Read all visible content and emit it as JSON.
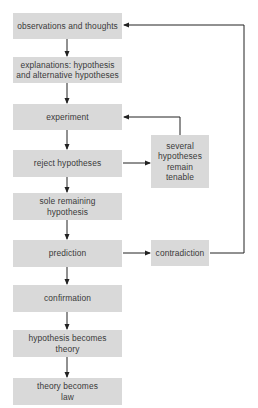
{
  "diagram": {
    "type": "flowchart",
    "main_flow": [
      {
        "id": "observations",
        "label": "observations and thoughts"
      },
      {
        "id": "explanations",
        "label": "explanations: hypothesis and alternative hypotheses"
      },
      {
        "id": "experiment",
        "label": "experiment"
      },
      {
        "id": "reject",
        "label": "reject hypotheses"
      },
      {
        "id": "sole",
        "label": "sole remaining hypothesis"
      },
      {
        "id": "prediction",
        "label": "prediction"
      },
      {
        "id": "confirmation",
        "label": "confirmation"
      },
      {
        "id": "hyp_theory",
        "label": "hypothesis becomes theory"
      },
      {
        "id": "theory_law",
        "label": "theory becomes law"
      }
    ],
    "side_nodes": [
      {
        "id": "several",
        "label": "several hypotheses remain tenable"
      },
      {
        "id": "contradiction",
        "label": "contradiction"
      }
    ],
    "edges": [
      {
        "from": "observations",
        "to": "explanations"
      },
      {
        "from": "explanations",
        "to": "experiment"
      },
      {
        "from": "experiment",
        "to": "reject"
      },
      {
        "from": "reject",
        "to": "sole"
      },
      {
        "from": "reject",
        "to": "several"
      },
      {
        "from": "several",
        "to": "experiment"
      },
      {
        "from": "sole",
        "to": "prediction"
      },
      {
        "from": "prediction",
        "to": "contradiction"
      },
      {
        "from": "contradiction",
        "to": "observations"
      },
      {
        "from": "prediction",
        "to": "confirmation"
      },
      {
        "from": "confirmation",
        "to": "hyp_theory"
      },
      {
        "from": "hyp_theory",
        "to": "theory_law"
      }
    ],
    "colors": {
      "box_fill": "#d9d9d9",
      "text": "#3a3a3a",
      "line": "#222222"
    }
  }
}
